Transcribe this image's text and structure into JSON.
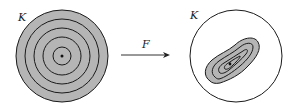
{
  "left_figure": {
    "label": "K",
    "description": "disk with concentric circular level sets and center point",
    "ring_count": 5,
    "fill_color": "#b5b5b5"
  },
  "arrow": {
    "label": "F"
  },
  "right_figure": {
    "label": "K",
    "description": "disk containing a deformed blob with nested level sets and a point",
    "ring_count": 4,
    "fill_color": "#b5b5b5"
  },
  "colors": {
    "stroke": "#1a1a1a",
    "fill": "#b5b5b5",
    "background": "#ffffff"
  }
}
